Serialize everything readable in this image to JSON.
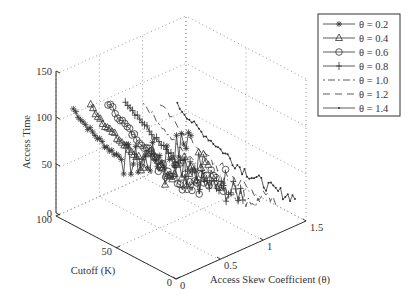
{
  "chart_data": {
    "type": "line3d",
    "title": "",
    "xlabel": "Access Skew Coefficient (θ)",
    "ylabel": "Cutoff (K)",
    "zlabel": "Access Time",
    "xlim": [
      0,
      1.5
    ],
    "ylim": [
      0,
      100
    ],
    "zlim": [
      0,
      150
    ],
    "xticks": [
      "0",
      "0.5",
      "1",
      "1.5"
    ],
    "yticks": [
      "0",
      "50",
      "100"
    ],
    "zticks": [
      "0",
      "50",
      "100",
      "150"
    ],
    "grid": true,
    "legend_position": "upper right (outside)",
    "series": [
      {
        "name": "θ = 0.2",
        "theta": 0.2,
        "marker": "asterisk",
        "line": "solid",
        "cutoff": [
          100,
          90,
          80,
          70,
          60,
          50,
          40,
          30,
          20,
          10,
          1
        ],
        "values": [
          105,
          95,
          88,
          82,
          80,
          82,
          90,
          100,
          110,
          125,
          148
        ]
      },
      {
        "name": "θ = 0.4",
        "theta": 0.4,
        "marker": "triangle",
        "line": "solid",
        "cutoff": [
          100,
          90,
          80,
          70,
          60,
          50,
          40,
          30,
          20,
          10,
          1
        ],
        "values": [
          100,
          90,
          82,
          76,
          72,
          70,
          72,
          78,
          85,
          95,
          105
        ]
      },
      {
        "name": "θ = 0.6",
        "theta": 0.6,
        "marker": "circle",
        "line": "solid",
        "cutoff": [
          100,
          90,
          80,
          70,
          60,
          50,
          40,
          30,
          20,
          10,
          1
        ],
        "values": [
          95,
          85,
          76,
          70,
          64,
          60,
          58,
          60,
          65,
          72,
          80
        ]
      },
      {
        "name": "θ = 0.8",
        "theta": 0.8,
        "marker": "plus",
        "line": "solid",
        "cutoff": [
          100,
          90,
          80,
          70,
          60,
          50,
          40,
          30,
          20,
          10,
          1
        ],
        "values": [
          90,
          80,
          70,
          62,
          55,
          50,
          47,
          46,
          48,
          52,
          58
        ]
      },
      {
        "name": "θ = 1.0",
        "theta": 1.0,
        "marker": "none",
        "line": "dashdot",
        "cutoff": [
          100,
          90,
          80,
          70,
          60,
          50,
          40,
          30,
          20,
          10,
          1
        ],
        "values": [
          80,
          70,
          60,
          52,
          46,
          42,
          38,
          36,
          35,
          36,
          38
        ]
      },
      {
        "name": "θ = 1.2",
        "theta": 1.2,
        "marker": "none",
        "line": "dashed",
        "cutoff": [
          100,
          90,
          80,
          70,
          60,
          50,
          40,
          30,
          20,
          10,
          1
        ],
        "values": [
          70,
          60,
          52,
          45,
          40,
          35,
          32,
          30,
          28,
          28,
          30
        ]
      },
      {
        "name": "θ = 1.4",
        "theta": 1.4,
        "marker": "dot",
        "line": "solid",
        "cutoff": [
          100,
          90,
          80,
          70,
          60,
          50,
          40,
          30,
          20,
          10,
          1
        ],
        "values": [
          60,
          52,
          45,
          40,
          35,
          30,
          27,
          25,
          24,
          25,
          28
        ]
      }
    ]
  },
  "legend": {
    "items": [
      {
        "label": "θ = 0.2",
        "marker": "asterisk",
        "dash": ""
      },
      {
        "label": "θ = 0.4",
        "marker": "triangle",
        "dash": ""
      },
      {
        "label": "θ = 0.6",
        "marker": "circle",
        "dash": ""
      },
      {
        "label": "θ = 0.8",
        "marker": "plus",
        "dash": ""
      },
      {
        "label": "θ = 1.0",
        "marker": "none",
        "dash": "2 3 7 3"
      },
      {
        "label": "θ = 1.2",
        "marker": "none",
        "dash": "7 5"
      },
      {
        "label": "θ = 1.4",
        "marker": "dot",
        "dash": ""
      }
    ]
  },
  "axes": {
    "z_label": "Access Time",
    "y_label": "Cutoff (K)",
    "x_label": "Access Skew Coefficient (θ)",
    "z_ticks": [
      "0",
      "50",
      "100",
      "150"
    ],
    "y_ticks": [
      "100",
      "50",
      "0"
    ],
    "x_ticks": [
      "0",
      "0.5",
      "1",
      "1.5"
    ]
  },
  "colors": {
    "line": "#333333",
    "grid": "#9a9a9a",
    "axis": "#333333"
  }
}
